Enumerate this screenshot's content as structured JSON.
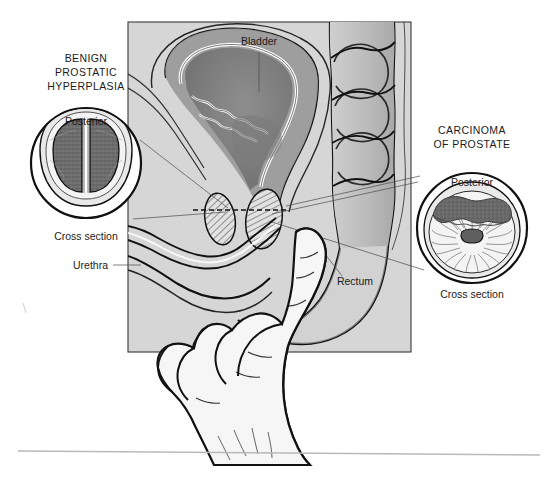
{
  "figure": {
    "title_alt": "Digital rectal examination of the prostate",
    "background_color": "#ffffff"
  },
  "panel": {
    "name": "sagittal-pelvis-panel",
    "fill_color": "#d6d6d6",
    "border_color": "#3a3a3a",
    "x": 128,
    "y": 22,
    "width": 283,
    "height": 330
  },
  "labels": {
    "bph_title_line1": "BENIGN",
    "bph_title_line2": "PROSTATIC",
    "bph_title_line3": "HYPERPLASIA",
    "carcinoma_title_line1": "CARCINOMA",
    "carcinoma_title_line2": "OF PROSTATE",
    "posterior_left": "Posterior",
    "posterior_right": "Posterior",
    "cross_section_left": "Cross section",
    "cross_section_right": "Cross section",
    "urethra": "Urethra",
    "bladder": "Bladder",
    "rectum": "Rectum"
  },
  "insets": {
    "left": {
      "name": "benign-prostatic-hyperplasia-inset",
      "center_x": 86,
      "center_y": 163,
      "radius": 56,
      "outline_color": "#111111",
      "capsule_color": "#e9e9e9",
      "lobe_color": "#6f6f6f",
      "description": "Symmetric enlarged lateral lobes separated by a median cleft"
    },
    "right": {
      "name": "carcinoma-of-prostate-inset",
      "center_x": 472,
      "center_y": 228,
      "radius": 56,
      "outline_color": "#111111",
      "capsule_color": "#e9e9e9",
      "gland_color": "#f2f2f2",
      "tumor_color": "#6a6a6a",
      "urethra_color": "#5a5a5a",
      "description": "Hard irregular nodular mass in the posterior lobe with radiating stroma and central urethra"
    }
  },
  "anatomy": {
    "bladder_wall_color": "#9a9a9a",
    "bladder_lumen_color": "#7d7d7d",
    "mucosa_highlight_color": "#ffffff",
    "colon_fill_color": "#bdbdbd",
    "prostate_hatch_color": "#2b2b2b",
    "hand_fill_color": "#f4f4f4",
    "section_plane_style": "dashed"
  },
  "footer": {
    "rule_color": "#b9b9b9"
  }
}
